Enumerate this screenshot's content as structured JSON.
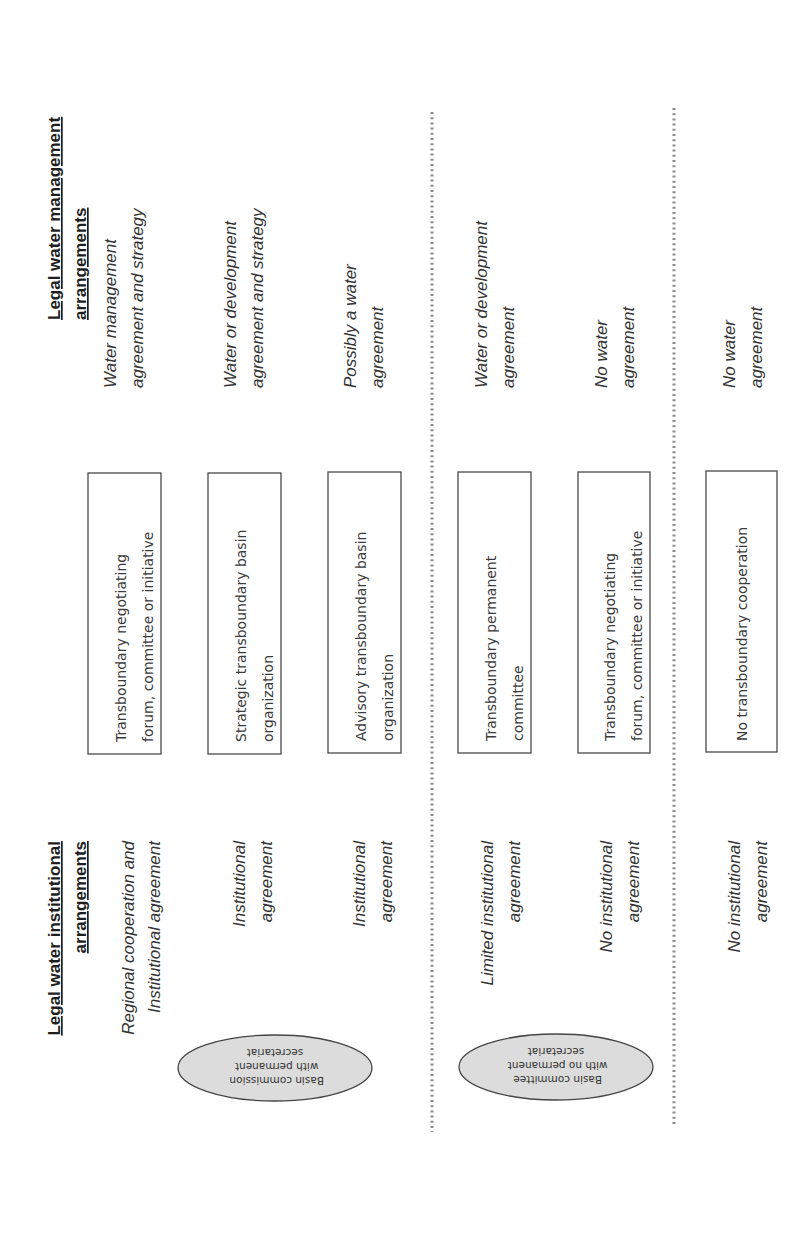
{
  "figure": {
    "orientation": "rotated 90 degrees counter-clockwise",
    "headers": {
      "institutional": [
        "Legal water institutional",
        "arrangements"
      ],
      "management": [
        "Legal water management",
        "arrangements"
      ]
    },
    "groups": [
      {
        "ellipse": [
          "Basin commission",
          "with permanent",
          "secretariat"
        ],
        "rows": [
          {
            "institutional": [
              "Regional cooperation and",
              "Institutional agreement"
            ],
            "organization": [
              "Transboundary negotiating",
              "forum, committee or initiative"
            ],
            "management": [
              "Water management",
              "agreement and strategy"
            ]
          },
          {
            "institutional": [
              "Institutional",
              "agreement"
            ],
            "organization": [
              "Strategic transboundary basin",
              "organization"
            ],
            "management": [
              "Water or development",
              "agreement and strategy"
            ]
          },
          {
            "institutional": [
              "Institutional",
              "agreement"
            ],
            "organization": [
              "Advisory transboundary basin",
              "organization"
            ],
            "management": [
              "Possibly a water",
              "agreement"
            ]
          }
        ]
      },
      {
        "ellipse": [
          "Basin committee",
          "with no permanent",
          "secretariat"
        ],
        "rows": [
          {
            "institutional": [
              "Limited institutional",
              "agreement"
            ],
            "organization": [
              "Transboundary permanent",
              "committee"
            ],
            "management": [
              "Water  or development",
              "agreement"
            ]
          },
          {
            "institutional": [
              "No institutional",
              "agreement"
            ],
            "organization": [
              "Transboundary negotiating",
              "forum, committee or initiative"
            ],
            "management": [
              "No water",
              "agreement"
            ]
          }
        ]
      },
      {
        "ellipse": null,
        "rows": [
          {
            "institutional": [
              "No institutional",
              "agreement"
            ],
            "organization": [
              "No transboundary cooperation"
            ],
            "management": [
              "No water",
              "agreement"
            ]
          }
        ]
      }
    ],
    "colors": {
      "ellipse_fill": "#dcdcdc",
      "separator": "#8c8c8c",
      "text": "#333333"
    }
  }
}
